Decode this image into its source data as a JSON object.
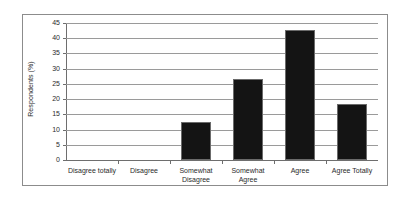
{
  "chart_data": {
    "type": "bar",
    "title": "",
    "xlabel": "",
    "ylabel": "Respondents (%)",
    "categories": [
      "Disagree totally",
      "Disagree",
      "Somewhat\nDisagree",
      "Somewhat\nAgree",
      "Agree",
      "Agree Totally"
    ],
    "values": [
      0,
      0,
      12.6,
      26.5,
      42.7,
      18.3
    ],
    "ylim": [
      0,
      45
    ],
    "yticks": [
      0,
      5,
      10,
      15,
      20,
      25,
      30,
      35,
      40,
      45
    ],
    "ytick_labels": [
      "0",
      "5",
      "10",
      "15",
      "20",
      "25",
      "30",
      "35",
      "40",
      "45"
    ],
    "grid": true,
    "legend": false,
    "bar_color": "#141414",
    "grid_color": "#9a9a9a",
    "axis_color": "#6e6e6e",
    "text_color": "#2b2b2b",
    "frame_color": "#8c8c8c",
    "background": "#ffffff"
  }
}
